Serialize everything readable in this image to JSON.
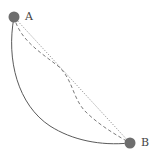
{
  "diagram": {
    "type": "path-comparison",
    "points": [
      {
        "id": "A",
        "label": "A",
        "x": 14,
        "y": 17,
        "r": 5,
        "color": "#6e6e6e"
      },
      {
        "id": "B",
        "label": "B",
        "x": 130,
        "y": 143,
        "r": 5,
        "color": "#6e6e6e"
      }
    ],
    "paths": [
      {
        "name": "straight-line-path",
        "style": "dotted",
        "color": "#8a8a8a"
      },
      {
        "name": "dashed-curve-path",
        "style": "dashed",
        "color": "#7a7a7a"
      },
      {
        "name": "cycloid-curve-path",
        "style": "solid",
        "color": "#5a5a5a"
      }
    ]
  }
}
